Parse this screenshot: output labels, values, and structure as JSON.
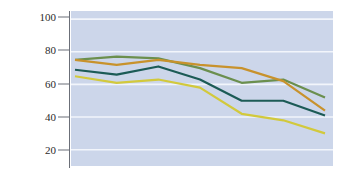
{
  "chart_data": {
    "type": "line",
    "title": "",
    "xlabel": "",
    "ylabel": "Percentage satisfied",
    "ylim": [
      10,
      105
    ],
    "yticks": [
      20,
      40,
      60,
      80,
      100
    ],
    "ytick_labels": [
      "20",
      "40",
      "60",
      "80",
      "100"
    ],
    "grid": "horizontal",
    "legend": "none",
    "x": [
      1,
      2,
      3,
      4,
      5,
      6,
      7
    ],
    "xtick_labels": [],
    "plot_background": "#ccd6ea",
    "gridline_color": "#f2f5fb",
    "axis_color": "#6b6f78",
    "series": [
      {
        "name": "series-green",
        "color": "#6b8f4e",
        "values": [
          75,
          77,
          76,
          70,
          61,
          63,
          52
        ]
      },
      {
        "name": "series-orange",
        "color": "#c8922c",
        "values": [
          75,
          72,
          75,
          72,
          70,
          62,
          44
        ]
      },
      {
        "name": "series-teal",
        "color": "#1c5b56",
        "values": [
          69,
          66,
          71,
          63,
          50,
          50,
          41
        ]
      },
      {
        "name": "series-yellow",
        "color": "#d2c93c",
        "values": [
          65,
          61,
          63,
          58,
          42,
          38,
          30
        ]
      }
    ]
  },
  "axis": {
    "ylabel": "Percentage satisfied",
    "tick_100": "100",
    "tick_80": "80",
    "tick_60": "60",
    "tick_40": "40",
    "tick_20": "20"
  }
}
